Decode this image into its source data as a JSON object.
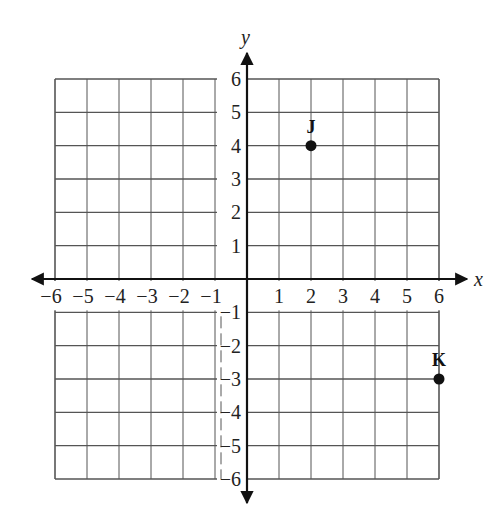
{
  "chart_data": {
    "type": "scatter",
    "title": "",
    "xlabel": "x",
    "ylabel": "y",
    "xlim": [
      -6,
      6
    ],
    "ylim": [
      -6,
      6
    ],
    "grid": true,
    "x_ticks": [
      -6,
      -5,
      -4,
      -3,
      -2,
      -1,
      1,
      2,
      3,
      4,
      5,
      6
    ],
    "y_ticks": [
      6,
      5,
      4,
      3,
      2,
      1,
      -1,
      -2,
      -3,
      -4,
      -5,
      -6
    ],
    "x_tick_labels": [
      "−6",
      "−5",
      "−4",
      "−3",
      "−2",
      "−1",
      "1",
      "2",
      "3",
      "4",
      "5",
      "6"
    ],
    "y_tick_labels": [
      "6",
      "5",
      "4",
      "3",
      "2",
      "1",
      "−1",
      "−2",
      "−3",
      "−4",
      "−5",
      "−6"
    ],
    "points": [
      {
        "label": "J",
        "x": 2,
        "y": 4
      },
      {
        "label": "K",
        "x": 6,
        "y": -3
      }
    ],
    "legend": null
  },
  "colors": {
    "grid": "#555555",
    "axis": "#111111",
    "point": "#111111",
    "background": "#ffffff"
  }
}
